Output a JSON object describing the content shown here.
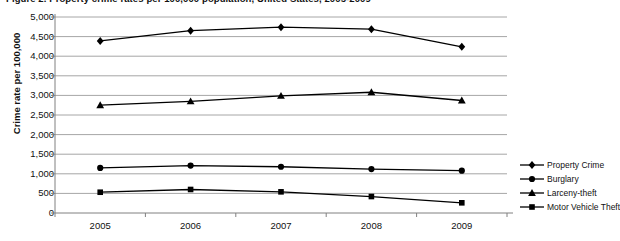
{
  "chart_data": {
    "type": "line",
    "title": "Figure 2.  Property crime rates per 100,000 population, United States, 2005-2009",
    "xlabel": "",
    "ylabel": "Crime rate per 100,000",
    "categories": [
      "2005",
      "2006",
      "2007",
      "2008",
      "2009"
    ],
    "ylim": [
      0,
      5000
    ],
    "ytick_labels": [
      "5,000",
      "4,500",
      "4,000",
      "3,500",
      "3,000",
      "2,500",
      "2,000",
      "1,500",
      "1,000",
      "500",
      "0"
    ],
    "ytick_values": [
      5000,
      4500,
      4000,
      3500,
      3000,
      2500,
      2000,
      1500,
      1000,
      500,
      0
    ],
    "grid": true,
    "legend_position": "right",
    "series": [
      {
        "name": "Property Crime",
        "marker": "diamond",
        "color": "#000000",
        "values": [
          4390,
          4650,
          4740,
          4690,
          4240
        ]
      },
      {
        "name": "Burglary",
        "marker": "circle",
        "color": "#000000",
        "values": [
          1150,
          1210,
          1180,
          1120,
          1080
        ]
      },
      {
        "name": "Larceny-theft",
        "marker": "triangle",
        "color": "#000000",
        "values": [
          2750,
          2850,
          2990,
          3080,
          2870
        ]
      },
      {
        "name": "Motor Vehicle Theft",
        "marker": "square",
        "color": "#000000",
        "values": [
          530,
          600,
          540,
          420,
          260
        ]
      }
    ]
  }
}
